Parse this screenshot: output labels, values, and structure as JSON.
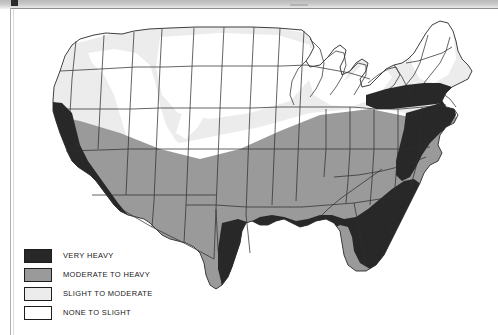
{
  "figure": {
    "region": "Contiguous United States"
  },
  "colors": {
    "very_heavy": "#282828",
    "moderate_to_heavy": "#9a9a9a",
    "slight_to_moderate": "#ececec",
    "none_to_slight": "#ffffff",
    "outline": "#2a2a2a",
    "background": "#ffffff",
    "scan_band": "#c4c4c4"
  },
  "legend": {
    "items": [
      {
        "label": "VERY HEAVY",
        "swatch": "very_heavy",
        "color": "#282828"
      },
      {
        "label": "MODERATE TO HEAVY",
        "swatch": "moderate_to_heavy",
        "color": "#9a9a9a"
      },
      {
        "label": "SLIGHT TO MODERATE",
        "swatch": "slight_to_moderate",
        "color": "#ececec"
      },
      {
        "label": "NONE TO SLIGHT",
        "swatch": "none_to_slight",
        "color": "#ffffff"
      }
    ]
  },
  "map_regions": {
    "very_heavy": "Pacific coast (California), Gulf Coast and Southeast, eastern Texas, Florida, Atlantic seaboard",
    "moderate_to_heavy": "Southwest, southern Plains, Midwest, Ohio Valley, mid-Atlantic",
    "slight_to_moderate": "Pacific Northwest, northern Rockies, northern Plains, upper Great Lakes, northern New England",
    "none_to_slight": "Interior Great Basin, central Rockies, portions of the northern Plains and Great Lakes"
  }
}
